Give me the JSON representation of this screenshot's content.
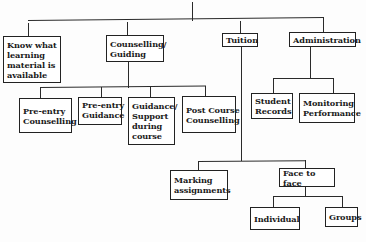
{
  "diagram": {
    "type": "hierarchy-tree",
    "root": {
      "label": "",
      "children": [
        {
          "id": "know",
          "label": "Know what learning material is available",
          "children": []
        },
        {
          "id": "counselling",
          "label": "Counselling/ Guiding",
          "children": [
            {
              "id": "pre-entry-counselling",
              "label": "Pre-entry Counselling"
            },
            {
              "id": "pre-entry-guidance",
              "label": "Pre-entry Guidance"
            },
            {
              "id": "guidance-support",
              "label": "Guidance/ Support during course"
            },
            {
              "id": "post-course",
              "label": "Post Course Counselling"
            }
          ]
        },
        {
          "id": "tuition",
          "label": "Tuition",
          "children": [
            {
              "id": "marking",
              "label": "Marking assignments"
            },
            {
              "id": "face-to-face",
              "label": "Face to face",
              "children": [
                {
                  "id": "individual",
                  "label": "Individual"
                },
                {
                  "id": "groups",
                  "label": "Groups"
                }
              ]
            }
          ]
        },
        {
          "id": "administration",
          "label": "Administration",
          "children": [
            {
              "id": "student-records",
              "label": "Student Records"
            },
            {
              "id": "monitoring",
              "label": "Monitoring Performance"
            }
          ]
        }
      ]
    },
    "nodes": {
      "know": "Know what learning material is available",
      "counselling": "Counselling/ Guiding",
      "tuition": "Tuition",
      "administration": "Administration",
      "pre_entry_counselling": "Pre-entry Counselling",
      "pre_entry_guidance": "Pre-entry Guidance",
      "guidance_support": "Guidance/ Support during course",
      "post_course": "Post Course Counselling",
      "student_records": "Student Records",
      "monitoring": "Monitoring Performance",
      "marking": "Marking assignments",
      "face_to_face": "Face to face",
      "individual": "Individual",
      "groups": "Groups"
    }
  }
}
